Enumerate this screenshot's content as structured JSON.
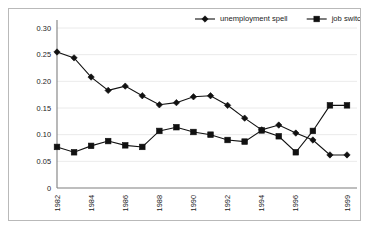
{
  "chart_data": {
    "type": "line",
    "title": "",
    "xlabel": "",
    "ylabel": "",
    "x": [
      1982,
      1983,
      1984,
      1985,
      1986,
      1987,
      1988,
      1989,
      1990,
      1991,
      1992,
      1993,
      1994,
      1995,
      1996,
      1997,
      1998,
      1999
    ],
    "xtick_labels": [
      "1982",
      "1984",
      "1986",
      "1988",
      "1990",
      "1992",
      "1994",
      "1996",
      "1999"
    ],
    "xtick_values": [
      1982,
      1984,
      1986,
      1988,
      1990,
      1992,
      1994,
      1996,
      1999
    ],
    "ytick_labels": [
      "0",
      "0.05",
      "0.10",
      "0.15",
      "0.20",
      "0.25",
      "0.30"
    ],
    "ytick_values": [
      0,
      0.05,
      0.1,
      0.15,
      0.2,
      0.25,
      0.3
    ],
    "ylim": [
      0,
      0.3
    ],
    "grid": "horizontal",
    "legend_position": "top-right",
    "series": [
      {
        "name": "unemployment spell",
        "marker": "diamond",
        "color": "#111111",
        "values": [
          0.255,
          0.244,
          0.208,
          0.183,
          0.191,
          0.173,
          0.156,
          0.16,
          0.171,
          0.173,
          0.155,
          0.131,
          0.109,
          0.118,
          0.103,
          0.09,
          0.062,
          0.062
        ]
      },
      {
        "name": "job switch",
        "marker": "square",
        "color": "#111111",
        "values": [
          0.077,
          0.067,
          0.079,
          0.088,
          0.08,
          0.077,
          0.107,
          0.114,
          0.105,
          0.1,
          0.09,
          0.087,
          0.108,
          0.097,
          0.067,
          0.107,
          0.155,
          0.155
        ]
      }
    ]
  },
  "legend": {
    "items": [
      {
        "label": "unemployment spell",
        "marker": "diamond"
      },
      {
        "label": "job switch",
        "marker": "square"
      }
    ]
  },
  "colors": {
    "series": "#111111",
    "gridline": "#e4e4e4",
    "axis": "#7f7f7f",
    "border": "#b9b9b9",
    "background": "#ffffff",
    "text": "#1a1a1a"
  }
}
